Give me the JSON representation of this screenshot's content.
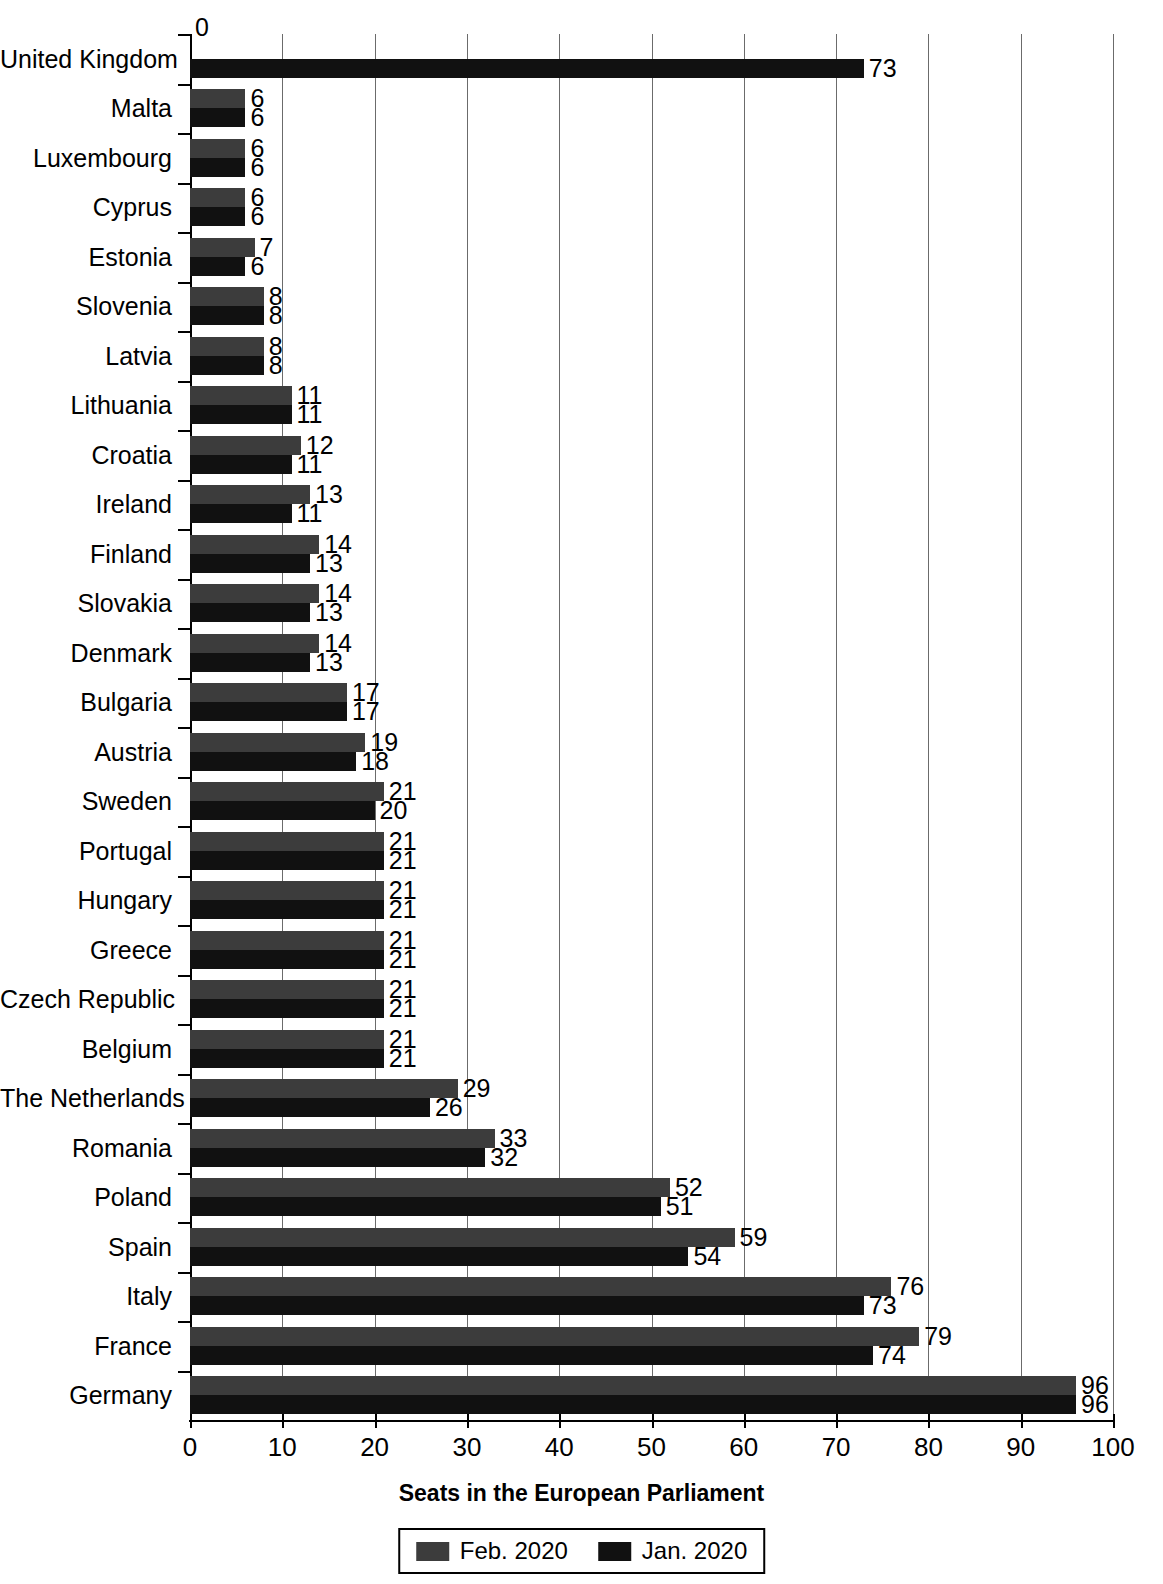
{
  "title_partial": "",
  "axis": {
    "x_title": "Seats in the European Parliament",
    "x_ticks": [
      "0",
      "10",
      "20",
      "30",
      "40",
      "50",
      "60",
      "70",
      "80",
      "90",
      "100"
    ],
    "x_min": 0,
    "x_max": 100
  },
  "legend": {
    "items": [
      {
        "label": "Feb. 2020",
        "color": "#3c3c3c"
      },
      {
        "label": "Jan. 2020",
        "color": "#111111"
      }
    ]
  },
  "chart_data": {
    "type": "bar",
    "orientation": "horizontal",
    "title": "Seats in the European Parliament",
    "xlabel": "Seats in the European Parliament",
    "ylabel": "",
    "xlim": [
      0,
      100
    ],
    "grid": true,
    "legend_position": "bottom",
    "categories": [
      "United Kingdom",
      "Malta",
      "Luxembourg",
      "Cyprus",
      "Estonia",
      "Slovenia",
      "Latvia",
      "Lithuania",
      "Croatia",
      "Ireland",
      "Finland",
      "Slovakia",
      "Denmark",
      "Bulgaria",
      "Austria",
      "Sweden",
      "Portugal",
      "Hungary",
      "Greece",
      "Czech Republic",
      "Belgium",
      "The Netherlands",
      "Romania",
      "Poland",
      "Spain",
      "Italy",
      "France",
      "Germany"
    ],
    "series": [
      {
        "name": "Feb. 2020",
        "color": "#3c3c3c",
        "values": [
          0,
          6,
          6,
          6,
          7,
          8,
          8,
          11,
          12,
          13,
          14,
          14,
          14,
          17,
          19,
          21,
          21,
          21,
          21,
          21,
          21,
          29,
          33,
          52,
          59,
          76,
          79,
          96
        ]
      },
      {
        "name": "Jan. 2020",
        "color": "#111111",
        "values": [
          73,
          6,
          6,
          6,
          6,
          8,
          8,
          11,
          11,
          11,
          13,
          13,
          13,
          17,
          18,
          20,
          21,
          21,
          21,
          21,
          21,
          26,
          32,
          51,
          54,
          73,
          74,
          96
        ]
      }
    ]
  }
}
